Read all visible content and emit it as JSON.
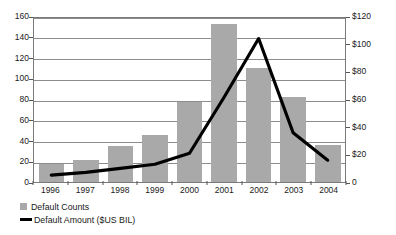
{
  "chart_data": {
    "type": "bar",
    "title": "",
    "xlabel": "",
    "ylabel": "",
    "categories": [
      "1996",
      "1997",
      "1998",
      "1999",
      "2000",
      "2001",
      "2002",
      "2003",
      "2004"
    ],
    "series": [
      {
        "name": "Default Counts",
        "type": "bar",
        "axis": "left",
        "values": [
          17,
          21,
          35,
          45,
          77,
          152,
          110,
          82,
          36
        ],
        "color": "#a9a9a9"
      },
      {
        "name": "Default Amount ($US BIL)",
        "type": "line",
        "axis": "right",
        "values": [
          5,
          7,
          10,
          13,
          21,
          62,
          105,
          36,
          16
        ],
        "color": "#000000"
      }
    ],
    "left_axis": {
      "ticks": [
        "0",
        "20",
        "40",
        "60",
        "80",
        "100",
        "120",
        "140",
        "160"
      ],
      "min": 0,
      "max": 160
    },
    "right_axis": {
      "ticks": [
        "0",
        "$20",
        "$40",
        "$60",
        "$80",
        "$100",
        "$120"
      ],
      "min": 0,
      "max": 120
    },
    "grid": true,
    "legend_position": "bottom-left",
    "plot_background": "#ffffff",
    "gridline_color": "#8c8c8c"
  },
  "legend": {
    "items": [
      {
        "label": "Default Counts"
      },
      {
        "label": "Default Amount ($US BIL)"
      }
    ]
  }
}
